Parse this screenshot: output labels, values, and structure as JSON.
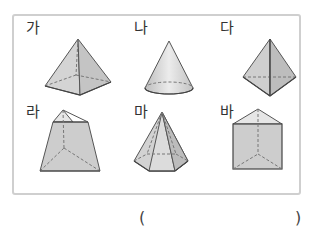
{
  "figure": {
    "items": [
      {
        "label": "가",
        "shape": "square-pyramid"
      },
      {
        "label": "나",
        "shape": "cone"
      },
      {
        "label": "다",
        "shape": "triangular-pyramid"
      },
      {
        "label": "라",
        "shape": "truncated-triangular-pyramid"
      },
      {
        "label": "마",
        "shape": "hexagonal-pyramid"
      },
      {
        "label": "바",
        "shape": "triangular-prism"
      }
    ]
  },
  "answer": {
    "open_paren": "(",
    "close_paren": ")",
    "value": ""
  }
}
